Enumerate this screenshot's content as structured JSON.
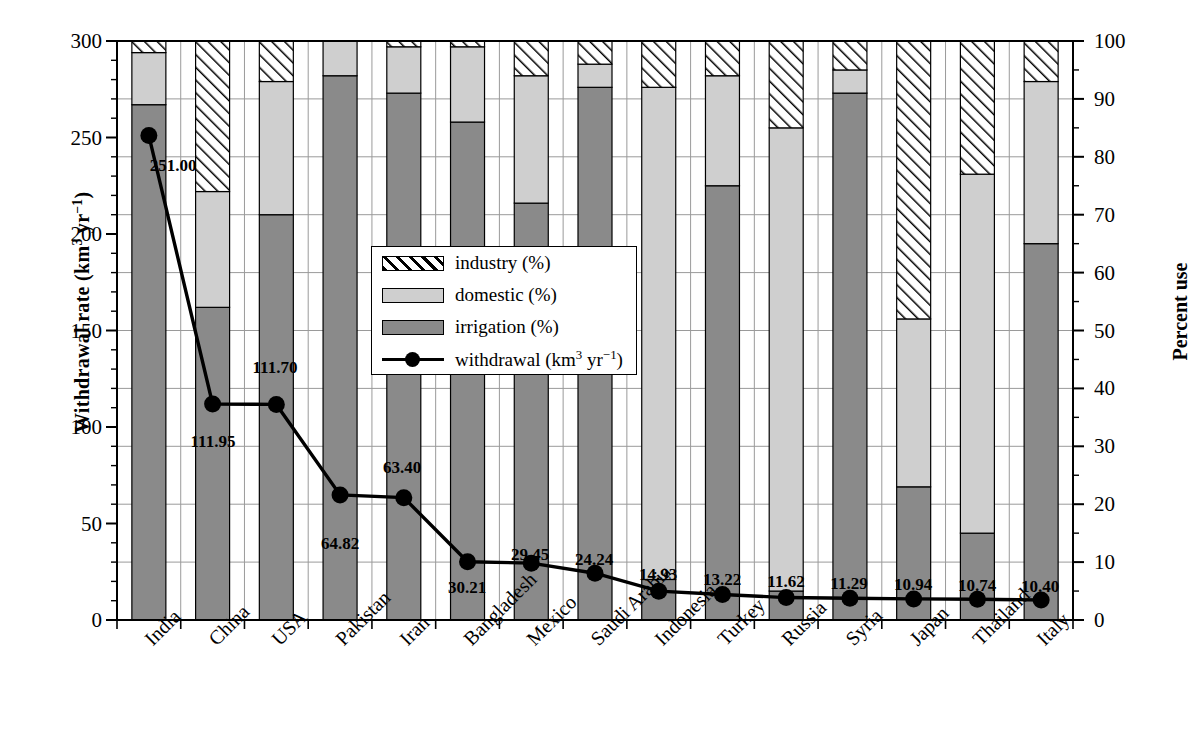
{
  "chart_data": {
    "type": "bar",
    "title": "",
    "subtitle": "",
    "ylabel_left": "Withdrawal rate (km3 yr-1)",
    "ylabel_right": "Percent use",
    "xlabel": "",
    "ylim_left": [
      0,
      300
    ],
    "ylim_right": [
      0,
      100
    ],
    "left_ticks": [
      0,
      50,
      100,
      150,
      200,
      250,
      300
    ],
    "right_ticks": [
      0,
      10,
      20,
      30,
      40,
      50,
      60,
      70,
      80,
      90,
      100
    ],
    "left_minor_step": 10,
    "right_minor_step": 5,
    "grid": true,
    "legend_position": "center-left-inside",
    "stack_note": "Stacked percentage bars read on the right axis (Percent use); the marker/line series is read on the left axis (Withdrawal rate).",
    "categories": [
      "India",
      "China",
      "USA",
      "Pakistan",
      "Iran",
      "Bangladesh",
      "Mexico",
      "Saudi Arabia",
      "Indonesia",
      "Turkey",
      "Russia",
      "Syria",
      "Japan",
      "Thailand",
      "Italy"
    ],
    "series": [
      {
        "name": "irrigation (%)",
        "unit": "%",
        "axis": "right",
        "color": "#8a8a8a",
        "values": [
          89,
          54,
          70,
          94,
          91,
          86,
          72,
          92,
          7,
          75,
          5,
          91,
          23,
          15,
          65
        ]
      },
      {
        "name": "domestic (%)",
        "unit": "%",
        "axis": "right",
        "color": "#cfcfcf",
        "values": [
          9,
          20,
          23,
          6,
          8,
          13,
          22,
          4,
          85,
          19,
          80,
          4,
          29,
          62,
          28
        ]
      },
      {
        "name": "industry (%)",
        "unit": "%",
        "axis": "right",
        "color": "#ffffff",
        "hatch": "diagonal",
        "values": [
          2,
          26,
          7,
          0,
          1,
          1,
          6,
          4,
          8,
          6,
          15,
          5,
          48,
          23,
          7
        ]
      },
      {
        "name": "withdrawal (km3 yr-1)",
        "unit": "km3 yr-1",
        "axis": "left",
        "color": "#000000",
        "marker": "filled-circle",
        "values": [
          251.0,
          111.95,
          111.7,
          64.82,
          63.4,
          30.21,
          29.45,
          24.24,
          14.93,
          13.22,
          11.62,
          11.29,
          10.94,
          10.74,
          10.4
        ]
      }
    ],
    "point_labels": [
      "251.00",
      "111.95",
      "111.70",
      "64.82",
      "63.40",
      "30.21",
      "29.45",
      "24.24",
      "14.93",
      "13.22",
      "11.62",
      "11.29",
      "10.94",
      "10.74",
      "10.40"
    ]
  },
  "legend": {
    "items": [
      {
        "label": "industry (%)",
        "key": "industry"
      },
      {
        "label": "domestic (%)",
        "key": "domestic"
      },
      {
        "label": "irrigation (%)",
        "key": "irrigation"
      },
      {
        "label": "withdrawal (km3 yr-1)",
        "key": "withdrawal"
      }
    ]
  },
  "axis_titles": {
    "left_main": "Withdrawal rate (km",
    "left_sup1": "3",
    "left_mid": " yr",
    "left_sup2": "−1",
    "left_end": ")",
    "right": "Percent use"
  }
}
